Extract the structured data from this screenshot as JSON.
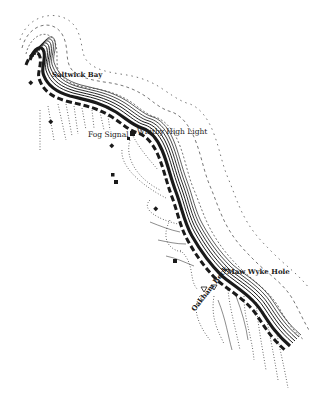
{
  "map": {
    "subject": "Coastline map from Saltwick Bay to Maw Wyke Hole",
    "ink_color": "#1a1a1a",
    "background_color": "#ffffff",
    "labels": [
      {
        "id": "saltwick-bay",
        "text": "Saltwick Bay",
        "style": "bold"
      },
      {
        "id": "whitby-high-light",
        "text": "Whitby High Light",
        "style": "regular"
      },
      {
        "id": "fog-signal",
        "text": "Fog Signal",
        "style": "regular"
      },
      {
        "id": "maw-wyke-hole",
        "text": "Maw Wyke Hole",
        "style": "bold"
      },
      {
        "id": "oakham-beck",
        "text": "Oakham Beck",
        "style": "bold"
      }
    ],
    "symbols": [
      {
        "type": "building",
        "count": 7
      },
      {
        "type": "lighthouse",
        "near": "Whitby High Light"
      },
      {
        "type": "triangle-marker",
        "count": 2,
        "near": "Oakham Beck"
      }
    ]
  }
}
